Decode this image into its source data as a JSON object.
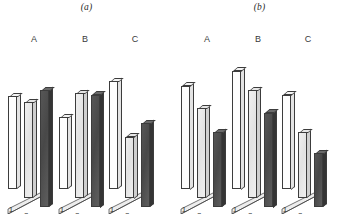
{
  "figure": {
    "type": "figure",
    "background": "#ffffff",
    "panel_count": 2
  },
  "panels": [
    {
      "id": "a",
      "label": "(a)"
    },
    {
      "id": "b",
      "label": "(b)"
    }
  ],
  "axis": {
    "group_labels": [
      "A",
      "B",
      "C"
    ],
    "series_tick_labels": [
      "1",
      "2",
      "3"
    ],
    "ymax": 100,
    "grid": false,
    "yaxis_visible": false,
    "xaxis_visible": false
  },
  "series_colors": {
    "series_1": "#fdfdfd",
    "series_2": "#e6e6e6",
    "series_3": "#4c4c4c",
    "outline": "#3c3c3c"
  },
  "chart_data": [
    {
      "type": "bar",
      "title": "(a)",
      "subtitle": "",
      "xlabel": "",
      "ylabel": "",
      "ylim": [
        0,
        100
      ],
      "grid": false,
      "legend": "none",
      "projection": "3d-isometric",
      "categories": [
        "A",
        "B",
        "C"
      ],
      "series": [
        {
          "name": "1",
          "values": [
            62,
            48,
            72
          ],
          "color": "#fdfdfd"
        },
        {
          "name": "2",
          "values": [
            64,
            70,
            41
          ],
          "color": "#e6e6e6"
        },
        {
          "name": "3",
          "values": [
            78,
            75,
            56
          ],
          "color": "#4c4c4c"
        }
      ]
    },
    {
      "type": "bar",
      "title": "(b)",
      "subtitle": "",
      "xlabel": "",
      "ylabel": "",
      "ylim": [
        0,
        100
      ],
      "grid": false,
      "legend": "none",
      "projection": "3d-isometric",
      "categories": [
        "A",
        "B",
        "C"
      ],
      "series": [
        {
          "name": "1",
          "values": [
            69,
            79,
            63
          ],
          "color": "#fdfdfd"
        },
        {
          "name": "2",
          "values": [
            60,
            72,
            44
          ],
          "color": "#e6e6e6"
        },
        {
          "name": "3",
          "values": [
            50,
            63,
            36
          ],
          "color": "#4c4c4c"
        }
      ]
    }
  ]
}
